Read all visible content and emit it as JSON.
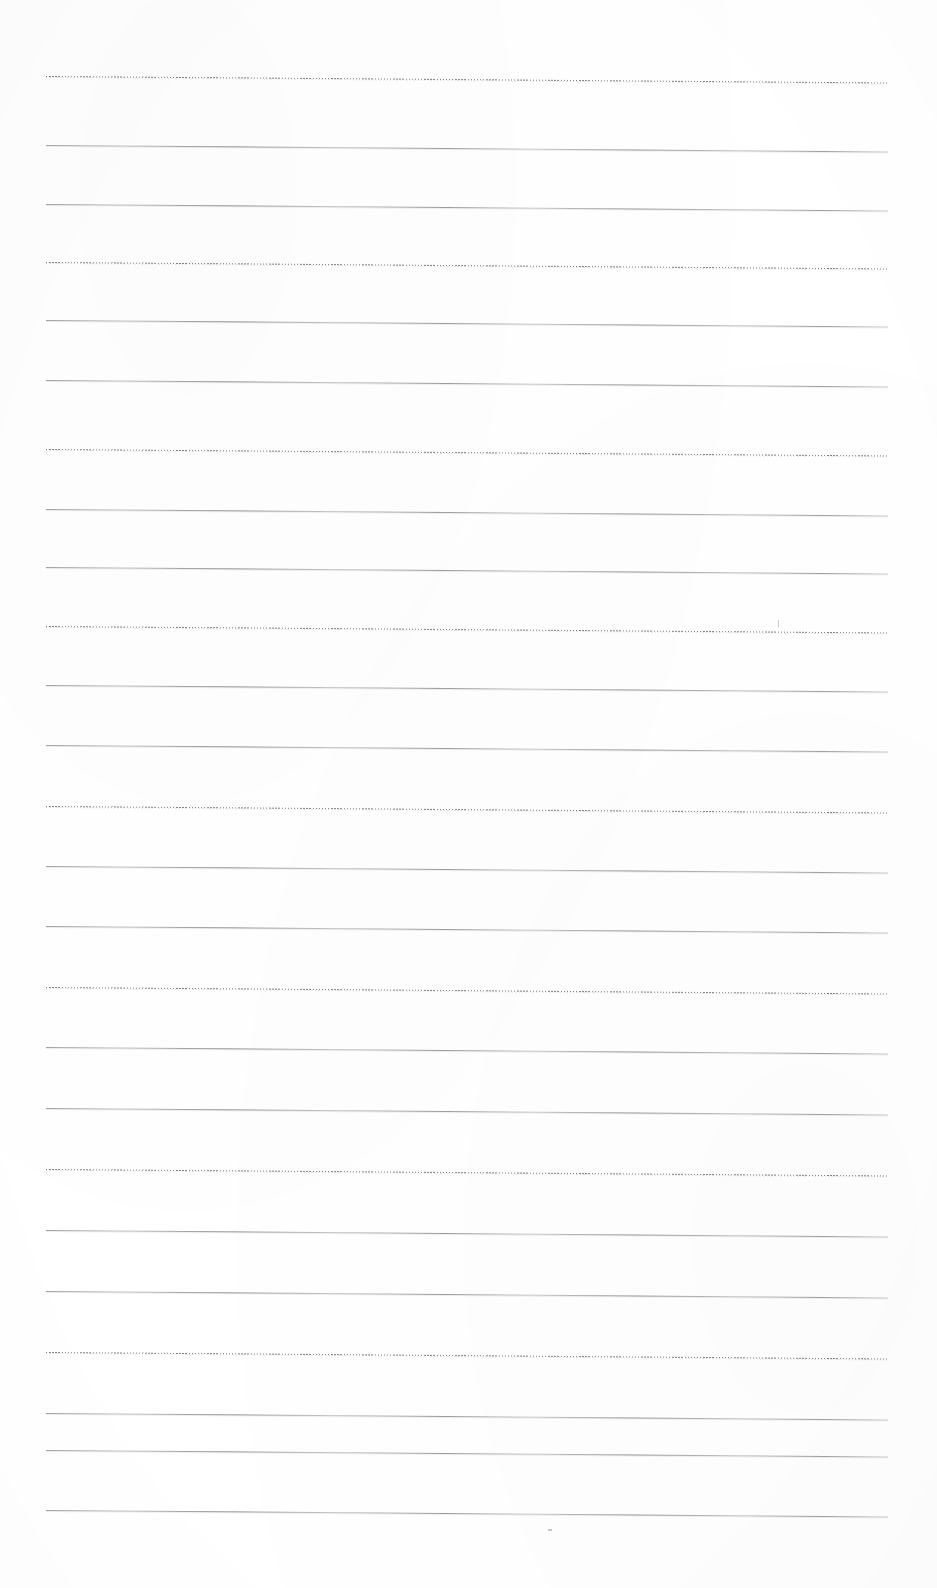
{
  "document": {
    "kind": "scanned-ruled-paper",
    "page_width_px": 937,
    "page_height_px": 1588,
    "background_color": "#ffffff",
    "has_visible_text": false,
    "has_page_border": false,
    "notes_content": ""
  },
  "ruling": {
    "line_count": 25,
    "left_edge_px": 46,
    "right_edge_px": 888,
    "line_length_px": 842,
    "average_spacing_px": 59.5,
    "first_line_y_px": 76,
    "last_line_y_px": 1510,
    "skew_drop_px": 6.5,
    "style_cycle": [
      "dotted",
      "solid",
      "solid"
    ],
    "solid_color": "#94949a",
    "dotted_color": "#787880",
    "lines": [
      {
        "index": 1,
        "y": 76,
        "style": "dotted"
      },
      {
        "index": 2,
        "y": 145,
        "style": "solid"
      },
      {
        "index": 3,
        "y": 204,
        "style": "solid"
      },
      {
        "index": 4,
        "y": 262,
        "style": "dotted"
      },
      {
        "index": 5,
        "y": 320,
        "style": "solid"
      },
      {
        "index": 6,
        "y": 380,
        "style": "solid"
      },
      {
        "index": 7,
        "y": 449,
        "style": "dotted"
      },
      {
        "index": 8,
        "y": 509,
        "style": "solid"
      },
      {
        "index": 9,
        "y": 567,
        "style": "solid"
      },
      {
        "index": 10,
        "y": 626,
        "style": "dotted"
      },
      {
        "index": 11,
        "y": 685,
        "style": "solid"
      },
      {
        "index": 12,
        "y": 745,
        "style": "solid"
      },
      {
        "index": 13,
        "y": 806,
        "style": "dotted"
      },
      {
        "index": 14,
        "y": 866,
        "style": "solid"
      },
      {
        "index": 15,
        "y": 926,
        "style": "solid"
      },
      {
        "index": 16,
        "y": 987,
        "style": "dotted"
      },
      {
        "index": 17,
        "y": 1047,
        "style": "solid"
      },
      {
        "index": 18,
        "y": 1108,
        "style": "solid"
      },
      {
        "index": 19,
        "y": 1169,
        "style": "dotted"
      },
      {
        "index": 20,
        "y": 1230,
        "style": "solid"
      },
      {
        "index": 21,
        "y": 1291,
        "style": "solid"
      },
      {
        "index": 22,
        "y": 1352,
        "style": "dotted"
      },
      {
        "index": 23,
        "y": 1413,
        "style": "solid"
      },
      {
        "index": 24,
        "y": 1450,
        "style": "solid"
      },
      {
        "index": 25,
        "y": 1510,
        "style": "solid"
      }
    ]
  },
  "artifacts": {
    "specks": [
      {
        "name": "speck-upper-right",
        "x": 778,
        "y": 620,
        "w": 1,
        "h": 7
      },
      {
        "name": "speck-lower-center",
        "x": 548,
        "y": 1529,
        "w": 4,
        "h": 2
      }
    ]
  }
}
